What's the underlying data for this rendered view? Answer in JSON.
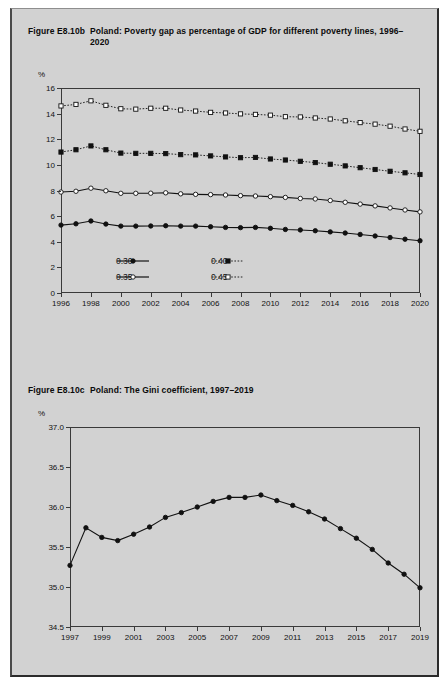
{
  "figure_b": {
    "number": "Figure E8.10b",
    "caption": "Poland: Poverty gap as percentage of GDP for different poverty lines, 1996–2020",
    "axis_unit": "%",
    "legend": [
      {
        "label": "0.30",
        "marker": "filled-circle",
        "line": "solid"
      },
      {
        "label": "0.35",
        "marker": "open-circle",
        "line": "solid"
      },
      {
        "label": "0.40",
        "marker": "filled-square",
        "line": "dotted"
      },
      {
        "label": "0.45",
        "marker": "open-square",
        "line": "dotted"
      }
    ]
  },
  "figure_c": {
    "number": "Figure E8.10c",
    "caption": "Poland: The Gini coefficient, 1997–2019",
    "axis_unit": "%"
  },
  "colors": {
    "page_background": "#d2d2d2",
    "ink": "#111111",
    "frame": "#3a3a3a",
    "marker_fill_open": "#ffffff"
  },
  "chart_data": [
    {
      "type": "line",
      "title": "Poland: Poverty gap as percentage of GDP for different poverty lines, 1996–2020",
      "xlabel": "",
      "ylabel": "%",
      "grid": false,
      "legend_position": "inside-bottom-left",
      "xlim": [
        1996,
        2020
      ],
      "ylim": [
        0,
        16
      ],
      "yticks": [
        0,
        2,
        4,
        6,
        8,
        10,
        12,
        14,
        16
      ],
      "xticks": [
        1996,
        1998,
        2000,
        2002,
        2004,
        2006,
        2008,
        2010,
        2012,
        2014,
        2016,
        2018,
        2020
      ],
      "x": [
        1996,
        1997,
        1998,
        1999,
        2000,
        2001,
        2002,
        2003,
        2004,
        2005,
        2006,
        2007,
        2008,
        2009,
        2010,
        2011,
        2012,
        2013,
        2014,
        2015,
        2016,
        2017,
        2018,
        2019,
        2020
      ],
      "series": [
        {
          "name": "0.30",
          "marker": "filled-circle",
          "line": "solid",
          "values": [
            5.3,
            5.4,
            5.62,
            5.38,
            5.22,
            5.22,
            5.23,
            5.25,
            5.22,
            5.22,
            5.17,
            5.12,
            5.1,
            5.12,
            5.05,
            4.96,
            4.92,
            4.86,
            4.77,
            4.68,
            4.57,
            4.45,
            4.33,
            4.2,
            4.08
          ]
        },
        {
          "name": "0.35",
          "marker": "open-circle",
          "line": "solid",
          "values": [
            7.88,
            7.94,
            8.18,
            7.98,
            7.78,
            7.78,
            7.79,
            7.82,
            7.74,
            7.7,
            7.68,
            7.65,
            7.6,
            7.57,
            7.52,
            7.46,
            7.38,
            7.34,
            7.22,
            7.08,
            6.94,
            6.8,
            6.64,
            6.48,
            6.33
          ]
        },
        {
          "name": "0.40",
          "marker": "filled-square",
          "line": "dotted",
          "values": [
            11.0,
            11.18,
            11.48,
            11.18,
            10.92,
            10.9,
            10.9,
            10.88,
            10.8,
            10.78,
            10.7,
            10.62,
            10.56,
            10.58,
            10.46,
            10.38,
            10.28,
            10.18,
            10.05,
            9.92,
            9.78,
            9.64,
            9.5,
            9.38,
            9.25
          ]
        },
        {
          "name": "0.45",
          "marker": "open-square",
          "line": "dotted",
          "values": [
            14.6,
            14.72,
            15.0,
            14.65,
            14.38,
            14.35,
            14.42,
            14.42,
            14.28,
            14.2,
            14.1,
            14.05,
            13.98,
            13.94,
            13.88,
            13.76,
            13.74,
            13.66,
            13.58,
            13.44,
            13.3,
            13.18,
            13.02,
            12.8,
            12.62
          ]
        }
      ]
    },
    {
      "type": "line",
      "title": "Poland: The Gini coefficient, 1997–2019",
      "xlabel": "",
      "ylabel": "%",
      "grid": false,
      "legend_position": "none",
      "xlim": [
        1997,
        2019
      ],
      "ylim": [
        34.5,
        37.0
      ],
      "yticks": [
        34.5,
        35.0,
        35.5,
        36.0,
        36.5,
        37.0
      ],
      "ytick_labels": [
        "34.5",
        "35.0",
        "35.5",
        "36.0",
        "36.5",
        "37.0"
      ],
      "xticks": [
        1997,
        1999,
        2001,
        2003,
        2005,
        2007,
        2009,
        2011,
        2013,
        2015,
        2017,
        2019
      ],
      "x": [
        1997,
        1998,
        1999,
        2000,
        2001,
        2002,
        2003,
        2004,
        2005,
        2006,
        2007,
        2008,
        2009,
        2010,
        2011,
        2012,
        2013,
        2014,
        2015,
        2016,
        2017,
        2018,
        2019
      ],
      "series": [
        {
          "name": "Gini coefficient",
          "marker": "filled-circle",
          "line": "solid",
          "values": [
            35.27,
            35.74,
            35.62,
            35.58,
            35.66,
            35.75,
            35.87,
            35.93,
            36.0,
            36.07,
            36.12,
            36.12,
            36.15,
            36.08,
            36.02,
            35.94,
            35.85,
            35.73,
            35.61,
            35.47,
            35.3,
            35.16,
            34.99
          ]
        }
      ]
    }
  ]
}
